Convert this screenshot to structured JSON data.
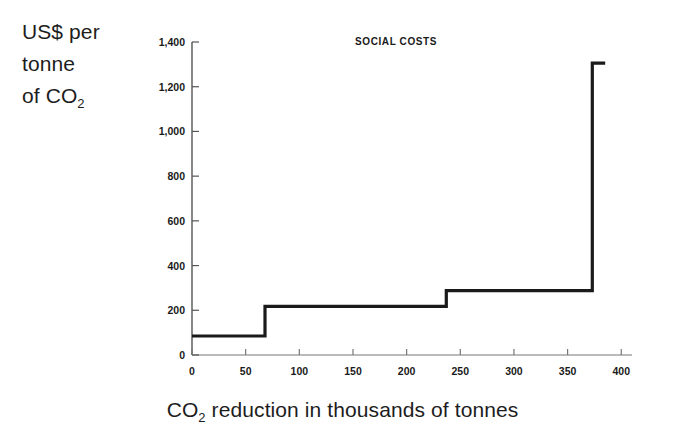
{
  "figure": {
    "y_caption_lines": [
      "US$ per",
      "tonne",
      "of CO"
    ],
    "y_caption_sub": "2",
    "x_caption_prefix": "CO",
    "x_caption_sub": "2",
    "x_caption_suffix": " reduction in thousands of tonnes",
    "line_color": "#1a1a1a",
    "axis_color": "#555555",
    "background": "#ffffff"
  },
  "chart_data": {
    "type": "line",
    "title": "SOCIAL COSTS",
    "xlabel": "CO2 reduction in thousands of tonnes",
    "ylabel": "US$ per tonne of CO2",
    "xlim": [
      0,
      410
    ],
    "ylim": [
      0,
      1400
    ],
    "xticks": [
      0,
      50,
      100,
      150,
      200,
      250,
      300,
      350,
      400
    ],
    "xtick_labels": [
      "0",
      "50",
      "100",
      "150",
      "200",
      "250",
      "300",
      "350",
      "400"
    ],
    "yticks": [
      0,
      200,
      400,
      600,
      800,
      1000,
      1200,
      1400
    ],
    "ytick_labels": [
      "0",
      "200",
      "400",
      "600",
      "800",
      "1,000",
      "1,200",
      "1,400"
    ],
    "grid": false,
    "legend": null,
    "step_style": "post",
    "steps": [
      {
        "x_start": 0,
        "x_end": 68,
        "y": 85
      },
      {
        "x_start": 68,
        "x_end": 237,
        "y": 218
      },
      {
        "x_start": 237,
        "x_end": 373,
        "y": 288
      },
      {
        "x_start": 373,
        "x_end": 385,
        "y": 1305
      }
    ],
    "x": [
      0,
      68,
      68,
      237,
      237,
      373,
      373,
      385
    ],
    "y": [
      85,
      85,
      218,
      218,
      288,
      288,
      1305,
      1305
    ]
  }
}
